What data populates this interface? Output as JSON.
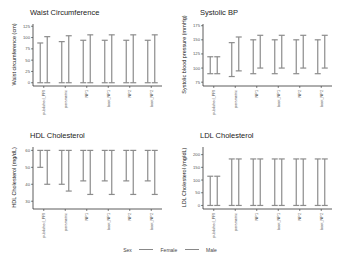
{
  "chart_data": [
    {
      "type": "errorbar",
      "title": "Waist Circumference",
      "xlabel": "",
      "ylabel": "Waist circumference (cm)",
      "categories": [
        "published_PRI",
        "parametric",
        "NP1",
        "boot_NP1",
        "NP2",
        "boot_NP2"
      ],
      "yticks": [
        0,
        25,
        50,
        75,
        100,
        125
      ],
      "ylim": [
        -5,
        130
      ],
      "series": [
        {
          "name": "Female",
          "low": [
            0,
            0,
            0,
            0,
            0,
            0
          ],
          "high": [
            88,
            91,
            94,
            94,
            94,
            94
          ]
        },
        {
          "name": "Male",
          "low": [
            0,
            0,
            0,
            0,
            0,
            0
          ],
          "high": [
            102,
            104,
            106,
            106,
            106,
            106
          ]
        }
      ]
    },
    {
      "type": "errorbar",
      "title": "Systolic BP",
      "xlabel": "",
      "ylabel": "Systolic blood pressure (mmHg)",
      "categories": [
        "published_PRI",
        "parametric",
        "NP1",
        "boot_NP1",
        "NP2",
        "boot_NP2"
      ],
      "yticks": [
        75,
        100,
        125,
        150,
        175
      ],
      "ylim": [
        70,
        178
      ],
      "series": [
        {
          "name": "Female",
          "low": [
            90,
            85,
            90,
            90,
            90,
            90
          ],
          "high": [
            120,
            145,
            150,
            150,
            150,
            150
          ]
        },
        {
          "name": "Male",
          "low": [
            90,
            95,
            100,
            100,
            100,
            100
          ],
          "high": [
            120,
            155,
            158,
            158,
            158,
            158
          ]
        }
      ]
    },
    {
      "type": "errorbar",
      "title": "HDL Cholesterol",
      "xlabel": "",
      "ylabel": "HDL Cholesterol (mg/dL)",
      "categories": [
        "published_PRI",
        "parametric",
        "NP1",
        "boot_NP1",
        "NP2",
        "boot_NP2"
      ],
      "yticks": [
        30,
        40,
        50,
        60
      ],
      "ylim": [
        26,
        62
      ],
      "series": [
        {
          "name": "Female",
          "low": [
            50,
            40,
            42,
            42,
            42,
            42
          ],
          "high": [
            60,
            60,
            60,
            60,
            60,
            60
          ]
        },
        {
          "name": "Male",
          "low": [
            40,
            36,
            34,
            34,
            34,
            34
          ],
          "high": [
            60,
            60,
            60,
            60,
            60,
            60
          ]
        }
      ]
    },
    {
      "type": "errorbar",
      "title": "LDL Cholesterol",
      "xlabel": "",
      "ylabel": "LDL Cholesterol (mg/dL)",
      "categories": [
        "published_PRI",
        "parametric",
        "NP1",
        "boot_NP1",
        "NP2",
        "boot_NP2"
      ],
      "yticks": [
        0,
        50,
        100,
        150,
        200
      ],
      "ylim": [
        -10,
        230
      ],
      "series": [
        {
          "name": "Female",
          "low": [
            0,
            0,
            0,
            0,
            0,
            0
          ],
          "high": [
            115,
            183,
            183,
            183,
            183,
            183
          ]
        },
        {
          "name": "Male",
          "low": [
            0,
            0,
            0,
            0,
            0,
            0
          ],
          "high": [
            115,
            183,
            183,
            183,
            183,
            183
          ]
        }
      ]
    }
  ],
  "legend": {
    "title": "Sex",
    "items": [
      "Female",
      "Male"
    ]
  },
  "colors": {
    "Female": "#8c8c8c",
    "Male": "#8c8c8c",
    "axis": "#333333",
    "text": "#222222"
  }
}
